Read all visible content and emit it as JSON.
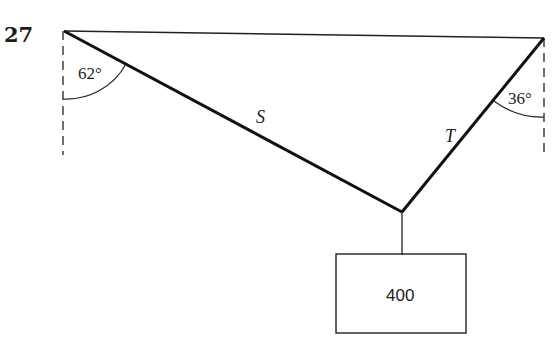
{
  "problem": {
    "number": "27"
  },
  "diagram": {
    "left_angle": "62°",
    "right_angle": "36°",
    "left_rope_label": "S",
    "right_rope_label": "T",
    "weight": "400"
  }
}
